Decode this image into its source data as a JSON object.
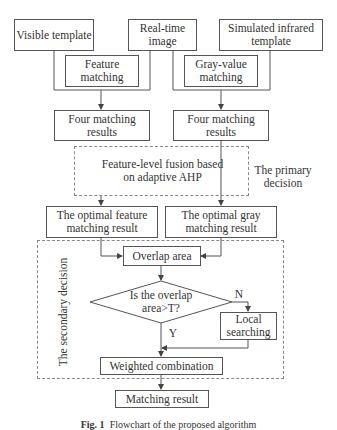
{
  "diagram": {
    "nodes": {
      "visible_template": "Visible template",
      "real_time_image": "Real-time image",
      "simulated_infrared_template": "Simulated infrared template",
      "feature_matching": "Feature matching",
      "gray_value_matching": "Gray-value matching",
      "four_matching_results_left": "Four matching results",
      "four_matching_results_right": "Four matching results",
      "feature_level_fusion": "Feature-level fusion based on adaptive AHP",
      "optimal_feature_result": "The optimal feature matching result",
      "optimal_gray_result": "The optimal gray matching result",
      "overlap_area": "Overlap area",
      "decision": "Is the overlap area>T?",
      "local_searching": "Local searching",
      "weighted_combination": "Weighted combination",
      "matching_result": "Matching result"
    },
    "groups": {
      "primary_decision": "The primary decision",
      "secondary_decision": "The secondary decision"
    },
    "edge_labels": {
      "no": "N",
      "yes": "Y"
    },
    "caption": {
      "fig_label": "Fig. 1",
      "text": "Flowchart of the proposed algorithm"
    }
  }
}
